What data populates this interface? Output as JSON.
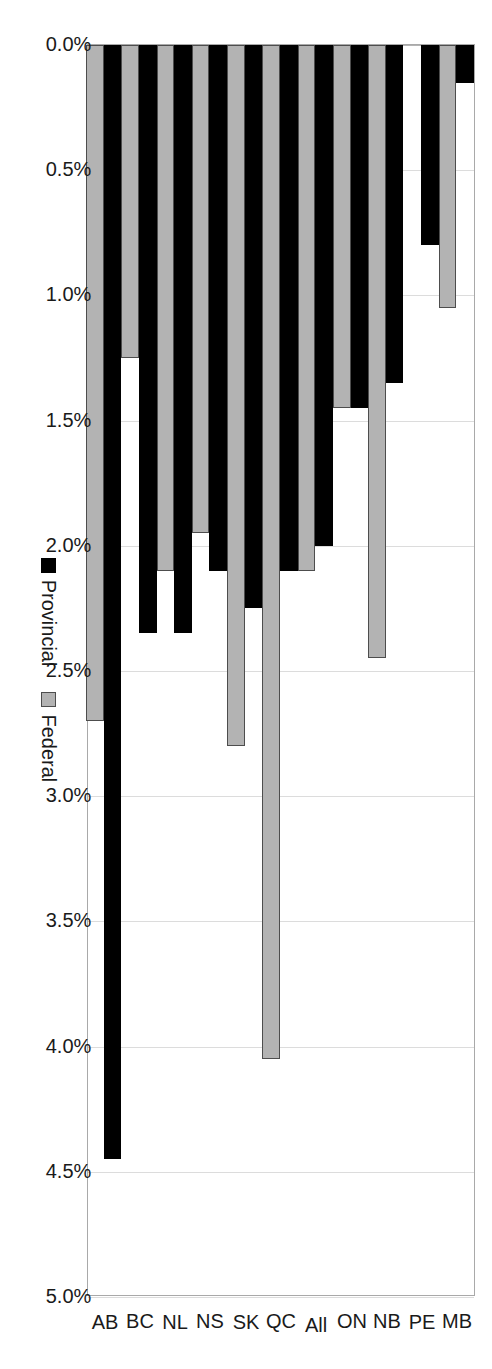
{
  "chart_data": {
    "type": "bar",
    "orientation": "horizontal",
    "title": "",
    "subtitle": "",
    "xlabel": "",
    "ylabel": "",
    "xlim": [
      0,
      5.0
    ],
    "xticks": [
      "0.0%",
      "0.5%",
      "1.0%",
      "1.5%",
      "2.0%",
      "2.5%",
      "3.0%",
      "3.5%",
      "4.0%",
      "4.5%",
      "5.0%"
    ],
    "xtick_values": [
      0.0,
      0.5,
      1.0,
      1.5,
      2.0,
      2.5,
      3.0,
      3.5,
      4.0,
      4.5,
      5.0
    ],
    "value_format": "percent",
    "grid": true,
    "grid_axis": "value",
    "legend_position": "bottom",
    "categories": [
      "MB",
      "PE",
      "NB",
      "ON",
      "All",
      "QC",
      "SK",
      "NS",
      "NL",
      "BC",
      "AB"
    ],
    "series": [
      {
        "name": "Provincial",
        "color": "#000000",
        "values": [
          0.15,
          0.8,
          1.35,
          1.45,
          2.0,
          2.1,
          2.25,
          2.1,
          2.35,
          2.35,
          4.45
        ]
      },
      {
        "name": "Federal",
        "color": "#b3b3b3",
        "values": [
          1.05,
          0.0,
          2.45,
          1.45,
          2.1,
          4.05,
          2.8,
          1.95,
          2.1,
          1.25,
          2.7
        ]
      }
    ]
  },
  "legend": {
    "items": [
      {
        "label": "Provincial",
        "swatch": "black-square-swatch"
      },
      {
        "label": "Federal",
        "swatch": "gray-square-swatch"
      }
    ]
  }
}
